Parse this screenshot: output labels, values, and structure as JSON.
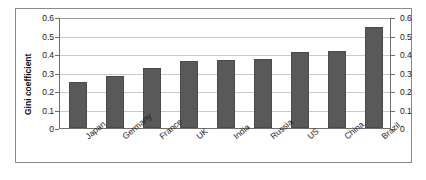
{
  "chart_data": {
    "type": "bar",
    "title": "",
    "xlabel": "",
    "ylabel": "Gini coefficient",
    "ylim": [
      0,
      0.6
    ],
    "ytick_values": [
      0,
      0.1,
      0.2,
      0.3,
      0.4,
      0.5,
      0.6
    ],
    "ytick_labels": [
      "0",
      "0.1",
      "0.2",
      "0.3",
      "0.4",
      "0.5",
      "0.6"
    ],
    "right_axis": {
      "visible": true,
      "ylim": [
        0,
        0.6
      ],
      "ytick_labels": [
        "0",
        "0.1",
        "0.2",
        "0.3",
        "0.4",
        "0.5",
        "0.6"
      ]
    },
    "grid": "horizontal",
    "legend": "none",
    "bar_color": "#595959",
    "bar_edge_color": "#4a4a4a",
    "gridline_color": "#c9c9c9",
    "axis_color": "#6e6e6e",
    "frame_color": "#8a8a8a",
    "background": "#ffffff",
    "categories": [
      "Japan",
      "Germany",
      "France",
      "UK",
      "India",
      "Russia",
      "US",
      "China",
      "Brazil"
    ],
    "values": [
      0.25,
      0.28,
      0.325,
      0.36,
      0.365,
      0.375,
      0.41,
      0.415,
      0.545
    ],
    "points": [
      {
        "category": "Japan",
        "value": 0.25
      },
      {
        "category": "Germany",
        "value": 0.28
      },
      {
        "category": "France",
        "value": 0.325
      },
      {
        "category": "UK",
        "value": 0.36
      },
      {
        "category": "India",
        "value": 0.365
      },
      {
        "category": "Russia",
        "value": 0.375
      },
      {
        "category": "US",
        "value": 0.41
      },
      {
        "category": "China",
        "value": 0.415
      },
      {
        "category": "Brazil",
        "value": 0.545
      }
    ]
  }
}
